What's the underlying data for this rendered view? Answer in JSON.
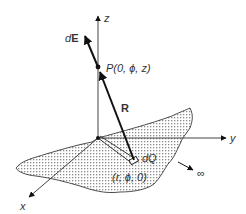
{
  "diagram": {
    "axes": {
      "z_label": "z",
      "y_label": "y",
      "x_label": "x"
    },
    "point_P": {
      "label_prefix": "P",
      "label_coords": "(0,  ϕ,  z)"
    },
    "field_vector": {
      "label_prefix": "d",
      "label_bold": "E"
    },
    "distance_vector": {
      "label": "R"
    },
    "charge_element": {
      "label": "dQ",
      "coords": "(r,  ϕ,  0)"
    },
    "infinity": {
      "label": "∞"
    },
    "colors": {
      "line": "#111111",
      "text": "#333333",
      "dots": "#8a8a8a"
    }
  }
}
